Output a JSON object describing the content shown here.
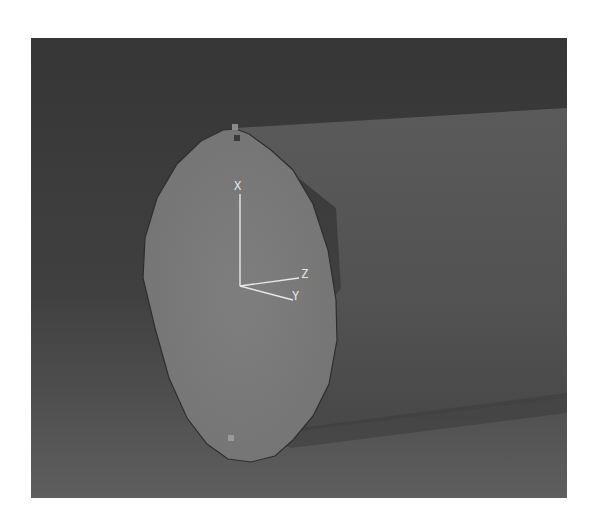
{
  "viewport": {
    "background_top": "#383838",
    "background_bottom": "#5a5a5a",
    "cylinder_side_color": "#565656",
    "end_face_color": "#7a7a7a",
    "edge_color": "#2e2e2e"
  },
  "triad": {
    "labels": {
      "x": "X",
      "y": "Y",
      "z": "Z"
    },
    "color": "#e8e8e8"
  },
  "nodes": {
    "top_marker_label": "1",
    "bottom_marker_label": "1"
  }
}
